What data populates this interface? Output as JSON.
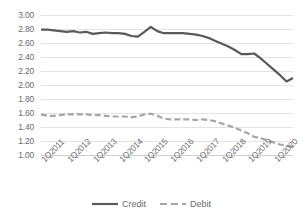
{
  "chart_data": {
    "type": "line",
    "title": "",
    "xlabel": "",
    "ylabel": "",
    "ylim": [
      1.0,
      3.0
    ],
    "ytick_step": 0.2,
    "grid": true,
    "legend_position": "bottom",
    "ytick_labels": [
      "3.00",
      "2.80",
      "2.60",
      "2.40",
      "2.20",
      "2.00",
      "1.80",
      "1.60",
      "1.40",
      "1.20",
      "1.00"
    ],
    "xtick_labels": [
      "1Q2011",
      "1Q2012",
      "1Q2013",
      "1Q2014",
      "1Q2015",
      "1Q2016",
      "1Q2017",
      "1Q2018",
      "1Q2019",
      "1Q2020"
    ],
    "x": [
      "1Q2011",
      "2Q2011",
      "3Q2011",
      "4Q2011",
      "1Q2012",
      "2Q2012",
      "3Q2012",
      "4Q2012",
      "1Q2013",
      "2Q2013",
      "3Q2013",
      "4Q2013",
      "1Q2014",
      "2Q2014",
      "3Q2014",
      "4Q2014",
      "1Q2015",
      "2Q2015",
      "3Q2015",
      "4Q2015",
      "1Q2016",
      "2Q2016",
      "3Q2016",
      "4Q2016",
      "1Q2017",
      "2Q2017",
      "3Q2017",
      "4Q2017",
      "1Q2018",
      "2Q2018",
      "3Q2018",
      "4Q2018",
      "1Q2019",
      "2Q2019",
      "3Q2019",
      "4Q2019",
      "1Q2020",
      "2Q2020",
      "3Q2020",
      "4Q2020"
    ],
    "series": [
      {
        "name": "Credit",
        "color": "#595959",
        "style": "solid",
        "width": 2.2,
        "values": [
          2.79,
          2.79,
          2.78,
          2.77,
          2.76,
          2.77,
          2.75,
          2.76,
          2.73,
          2.74,
          2.75,
          2.74,
          2.74,
          2.73,
          2.7,
          2.69,
          2.76,
          2.83,
          2.77,
          2.74,
          2.74,
          2.74,
          2.74,
          2.73,
          2.72,
          2.7,
          2.67,
          2.63,
          2.59,
          2.55,
          2.5,
          2.44,
          2.44,
          2.45,
          2.38,
          2.3,
          2.22,
          2.14,
          2.05,
          2.1
        ]
      },
      {
        "name": "Debit",
        "color": "#a6a6a6",
        "style": "dashed",
        "width": 2.2,
        "values": [
          1.58,
          1.56,
          1.56,
          1.57,
          1.58,
          1.58,
          1.58,
          1.58,
          1.57,
          1.57,
          1.56,
          1.55,
          1.55,
          1.55,
          1.54,
          1.55,
          1.58,
          1.59,
          1.56,
          1.52,
          1.51,
          1.51,
          1.51,
          1.51,
          1.5,
          1.51,
          1.5,
          1.48,
          1.45,
          1.42,
          1.39,
          1.35,
          1.31,
          1.26,
          1.24,
          1.21,
          1.18,
          1.15,
          1.13,
          1.12
        ]
      }
    ],
    "legend": [
      {
        "label": "Credit",
        "color": "#595959",
        "style": "solid"
      },
      {
        "label": "Debit",
        "color": "#a6a6a6",
        "style": "dashed"
      }
    ],
    "colors": {
      "gridline": "#e3e3e3",
      "tick_text": "#6b6b6b",
      "background": "#ffffff"
    }
  }
}
